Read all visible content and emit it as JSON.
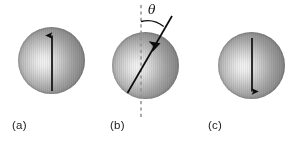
{
  "figure": {
    "type": "diagram",
    "background_color": "#ffffff",
    "canvas": {
      "width": 300,
      "height": 141
    },
    "sphere_style": {
      "highlight_color": "#f2f2f2",
      "edge_color": "#7e7e7e",
      "outline_color": "#5a5a5a",
      "highlight_position": "38% 52%",
      "texture": "vertical-stripes"
    },
    "arrow_color": "#0d0d0d",
    "guide_color": "#8c8c8c"
  },
  "panels": [
    {
      "id": "a",
      "label": "(a)",
      "label_x": 12,
      "label_y": 119,
      "sphere": {
        "cx": 51.5,
        "cy": 60,
        "r": 33.5
      },
      "arrow": {
        "name": "magnetization-arrow-up",
        "direction": "up",
        "x1": 52,
        "y1": 91,
        "x2": 52,
        "y2": 33,
        "angle_deg": 0
      },
      "guide_line": null,
      "angle_arc": null,
      "angle_symbol": null
    },
    {
      "id": "b",
      "label": "(b)",
      "label_x": 110,
      "label_y": 119,
      "sphere": {
        "cx": 145.5,
        "cy": 65,
        "r": 33.5
      },
      "arrow": {
        "name": "magnetization-arrow-tilted",
        "direction": "tilted",
        "x1": 127,
        "y1": 93,
        "x2": 172,
        "y2": 16,
        "angle_deg": 30
      },
      "guide_line": {
        "name": "vertical-axis-dashed-line",
        "x1": 141,
        "y1": 5,
        "x2": 141,
        "y2": 117,
        "style": "dashed"
      },
      "angle_arc": {
        "name": "angle-arc",
        "center_x": 141,
        "center_y": 46,
        "radius": 26,
        "from_deg": 90,
        "to_deg": 60
      },
      "angle_symbol": {
        "text": "θ",
        "x": 148,
        "y": 3
      }
    },
    {
      "id": "c",
      "label": "(c)",
      "label_x": 208,
      "label_y": 119,
      "sphere": {
        "cx": 251.5,
        "cy": 65,
        "r": 33.5
      },
      "arrow": {
        "name": "magnetization-arrow-down",
        "direction": "down",
        "x1": 252,
        "y1": 38,
        "x2": 252,
        "y2": 94,
        "angle_deg": 180
      },
      "guide_line": null,
      "angle_arc": null,
      "angle_symbol": null
    }
  ]
}
